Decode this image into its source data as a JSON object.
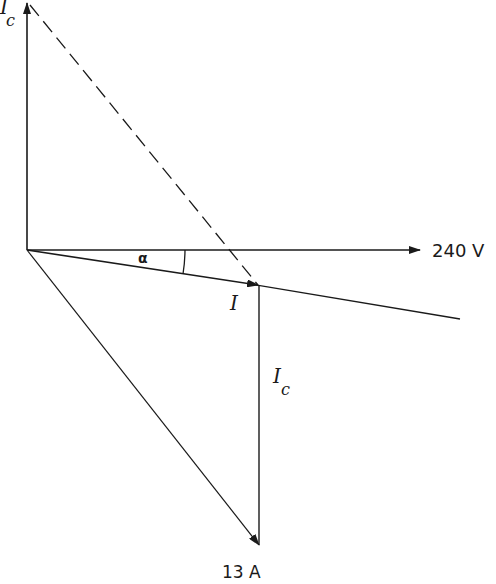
{
  "diagram": {
    "type": "phasor-diagram",
    "labels": {
      "ic_top": "I",
      "ic_top_sub": "c",
      "voltage": "240 V",
      "angle": "α",
      "current": "I",
      "ic_right": "I",
      "ic_right_sub": "c",
      "total_current": "13 A"
    },
    "phasors": [
      {
        "name": "Ic (capacitor current, up)",
        "from": [
          27,
          250
        ],
        "to": [
          27,
          2
        ],
        "style": "solid",
        "arrow": true
      },
      {
        "name": "240 V reference",
        "from": [
          27,
          250
        ],
        "to": [
          420,
          250
        ],
        "style": "solid",
        "arrow": true
      },
      {
        "name": "I (resultant)",
        "from": [
          27,
          250
        ],
        "to": [
          258,
          285
        ],
        "style": "solid",
        "arrow": true
      },
      {
        "name": "I extension line",
        "from": [
          258,
          285
        ],
        "to": [
          460,
          319
        ],
        "style": "solid",
        "arrow": false
      },
      {
        "name": "Ic (vertical, down)",
        "from": [
          259,
          285
        ],
        "to": [
          259,
          545
        ],
        "style": "solid",
        "arrow": false
      },
      {
        "name": "13 A",
        "from": [
          27,
          250
        ],
        "to": [
          259,
          545
        ],
        "style": "solid",
        "arrow": true
      },
      {
        "name": "construction line",
        "from": [
          30,
          5
        ],
        "to": [
          258,
          285
        ],
        "style": "dashed",
        "arrow": false
      }
    ],
    "colors": {
      "stroke": "#1a1a1a",
      "background": "#ffffff"
    }
  }
}
